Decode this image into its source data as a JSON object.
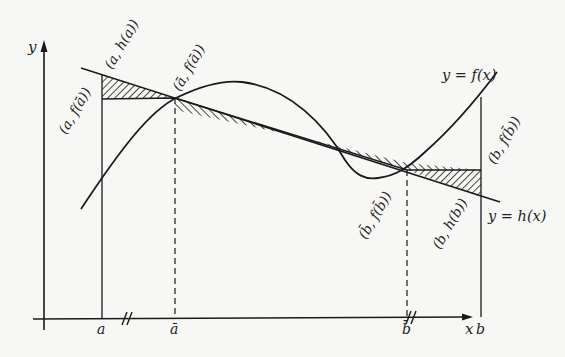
{
  "diagram": {
    "axes": {
      "x_label": "x",
      "y_label": "y"
    },
    "ticks": {
      "a": "a",
      "a_bar": "ā",
      "b_bar": "b̄",
      "b": "b",
      "break_mark": "//"
    },
    "curves": {
      "f_label": "y = f(x)",
      "h_label": "y = h(x)"
    },
    "points": {
      "a_f_abar": "(a, f(ā))",
      "a_h_a": "(a, h(a))",
      "abar_f_abar": "(ā, f(ā))",
      "bbar_f_bbar": "(b̄, f(b̄))",
      "b_h_b": "(b, h(b))",
      "b_f_bbar": "(b, f(b̄))"
    },
    "colors": {
      "ink": "#1a1a1a",
      "paper": "#f7f7f5"
    }
  }
}
